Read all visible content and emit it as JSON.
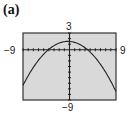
{
  "figure_label": "(a)",
  "labels": {
    "ymax": "3",
    "ymin": "-9",
    "xmin": "−9",
    "xmax": "9",
    "ymin_disp": "−9"
  },
  "chart_data": {
    "type": "line",
    "title": "(a)",
    "xlabel": "",
    "ylabel": "",
    "xlim": [
      -9,
      9
    ],
    "ylim": [
      -9,
      3
    ],
    "xscale_ticks": 1,
    "yscale_ticks": 1,
    "grid": false,
    "background": "#d9d9d9",
    "series": [
      {
        "name": "parabola",
        "function": "y = -0.104(x + 0.3)^2 + 1.5",
        "x": [
          -9,
          -8,
          -7,
          -6,
          -5,
          -4,
          -3,
          -2,
          -1,
          0,
          1,
          2,
          3,
          4,
          5,
          6,
          7,
          8,
          9
        ],
        "values": [
          -6.37,
          -5.66,
          -4.04,
          -2.63,
          -1.42,
          -0.42,
          0.37,
          0.95,
          1.45,
          1.49,
          1.32,
          0.95,
          0.37,
          -0.42,
          -1.42,
          -2.63,
          -4.04,
          -5.66,
          -7.44
        ]
      }
    ]
  }
}
